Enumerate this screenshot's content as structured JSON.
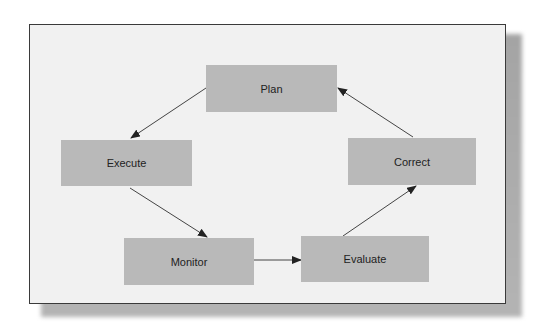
{
  "diagram": {
    "type": "cycle",
    "nodes": [
      {
        "id": "plan",
        "label": "Plan"
      },
      {
        "id": "execute",
        "label": "Execute"
      },
      {
        "id": "monitor",
        "label": "Monitor"
      },
      {
        "id": "evaluate",
        "label": "Evaluate"
      },
      {
        "id": "correct",
        "label": "Correct"
      }
    ],
    "edges": [
      {
        "from": "plan",
        "to": "execute"
      },
      {
        "from": "execute",
        "to": "monitor"
      },
      {
        "from": "monitor",
        "to": "evaluate"
      },
      {
        "from": "evaluate",
        "to": "correct"
      },
      {
        "from": "correct",
        "to": "plan"
      }
    ]
  },
  "colors": {
    "node_fill": "#b9b9b9",
    "frame_bg": "#f1f1f1",
    "frame_border": "#3a3a3a",
    "arrow": "#333333",
    "shadow": "#a8a8a8"
  }
}
